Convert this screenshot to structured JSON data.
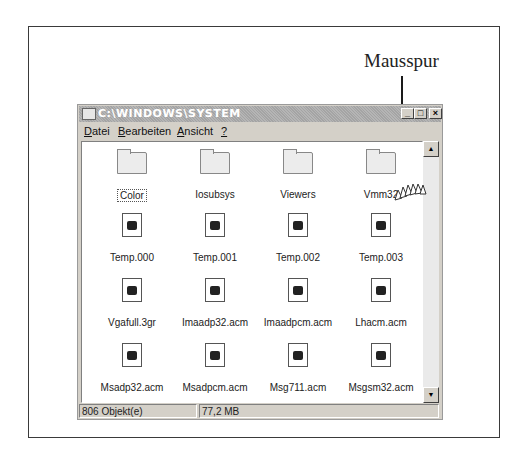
{
  "caption": "Mausspur",
  "window": {
    "title": "C:\\WINDOWS\\SYSTEM",
    "controls": {
      "minimize": "_",
      "maximize": "□",
      "close": "×"
    },
    "menu": [
      {
        "label": "Datei",
        "accel": "D"
      },
      {
        "label": "Bearbeiten",
        "accel": "B"
      },
      {
        "label": "Ansicht",
        "accel": "A"
      },
      {
        "label": "?",
        "accel": "?"
      }
    ],
    "items": [
      {
        "name": "Color",
        "type": "folder",
        "selected": true
      },
      {
        "name": "Iosubsys",
        "type": "folder"
      },
      {
        "name": "Viewers",
        "type": "folder"
      },
      {
        "name": "Vmm32",
        "type": "folder"
      },
      {
        "name": "Temp.000",
        "type": "file"
      },
      {
        "name": "Temp.001",
        "type": "file"
      },
      {
        "name": "Temp.002",
        "type": "file"
      },
      {
        "name": "Temp.003",
        "type": "file"
      },
      {
        "name": "Vgafull.3gr",
        "type": "file"
      },
      {
        "name": "Imaadp32.acm",
        "type": "file"
      },
      {
        "name": "Imaadpcm.acm",
        "type": "file"
      },
      {
        "name": "Lhacm.acm",
        "type": "file"
      },
      {
        "name": "Msadp32.acm",
        "type": "file"
      },
      {
        "name": "Msadpcm.acm",
        "type": "file"
      },
      {
        "name": "Msg711.acm",
        "type": "file"
      },
      {
        "name": "Msgsm32.acm",
        "type": "file"
      }
    ],
    "status": {
      "objects": "806 Objekt(e)",
      "size": "77,2 MB"
    }
  }
}
